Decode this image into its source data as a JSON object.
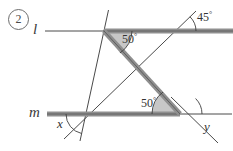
{
  "figure": {
    "problem_number": "2",
    "type": "geometry-diagram",
    "line_labels": {
      "top_line": "l",
      "bottom_line": "m"
    },
    "angle_labels": [
      {
        "name": "angle-45",
        "text": "45",
        "degree_symbol": "°",
        "value": 45
      },
      {
        "name": "angle-50-top",
        "text": "50",
        "degree_symbol": "°",
        "value": 50
      },
      {
        "name": "angle-50-bottom",
        "text": "50",
        "degree_symbol": "°",
        "value": 50
      },
      {
        "name": "angle-x",
        "text": "x",
        "value": null
      },
      {
        "name": "angle-y",
        "text": "y",
        "value": null
      }
    ],
    "colors": {
      "line_thin": "#4a4a4a",
      "line_thick": "#9a9a9a",
      "line_thick_edge": "#6e6e6e",
      "angle_fill": "#b8b8b8",
      "text": "#2b2b2b",
      "background": "#ffffff"
    },
    "geometry": {
      "line_l_y": 31,
      "line_m_y": 114,
      "top_intersection": [
        104,
        31
      ],
      "bottom_intersection": [
        180,
        114
      ],
      "top_right_intersection": [
        176,
        31
      ],
      "bottom_left_intersection": [
        86,
        114
      ]
    }
  }
}
